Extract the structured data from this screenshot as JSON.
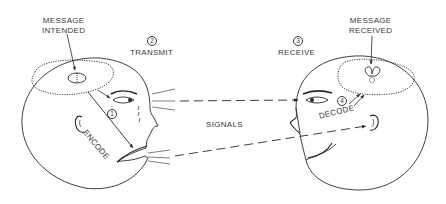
{
  "diagram": {
    "labels": {
      "message_intended": "MESSAGE\nINTENDED",
      "message_intended_l1": "MESSAGE",
      "message_intended_l2": "INTENDED",
      "message_received_l1": "MESSAGE",
      "message_received_l2": "RECEIVED",
      "transmit": "TRANSMIT",
      "receive": "RECEIVE",
      "signals": "SIGNALS",
      "encode": "ENCODE",
      "decode": "DECODE"
    },
    "steps": [
      {
        "number": "1",
        "label": "ENCODE"
      },
      {
        "number": "2",
        "label": "TRANSMIT"
      },
      {
        "number": "3",
        "label": "RECEIVE"
      },
      {
        "number": "4",
        "label": "DECODE"
      }
    ],
    "nodes": [
      {
        "id": "sender-head",
        "role": "sender",
        "annotation": "MESSAGE INTENDED"
      },
      {
        "id": "receiver-head",
        "role": "receiver",
        "annotation": "MESSAGE RECEIVED"
      }
    ],
    "edges": [
      {
        "from": "sender-eye",
        "to": "receiver-eye",
        "style": "dashed-arrow",
        "label": "SIGNALS"
      },
      {
        "from": "sender-mouth",
        "to": "receiver-ear",
        "style": "dashed-arrow",
        "label": "SIGNALS"
      }
    ],
    "colors": {
      "line": "#2a2a2a",
      "background": "#ffffff"
    }
  }
}
